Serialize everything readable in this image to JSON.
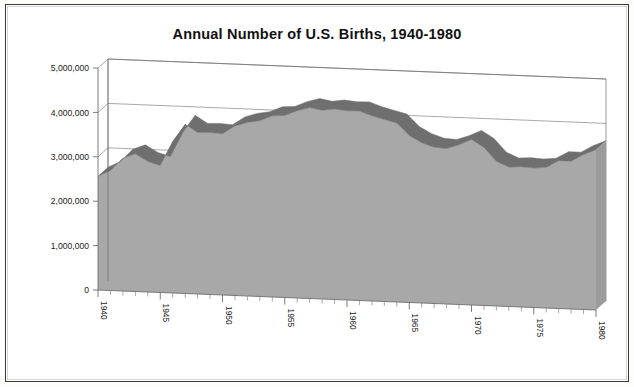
{
  "page": {
    "title": "Annual Number of U.S. Births, 1940-1980",
    "frame_color": "#3a3a3a",
    "background": "#ffffff"
  },
  "chart_data": {
    "type": "area",
    "title": "Annual Number of U.S. Births, 1940-1980",
    "xlabel": "",
    "ylabel": "",
    "ylim": [
      0,
      5000000
    ],
    "xlim": [
      1940,
      1980
    ],
    "grid": true,
    "legend": false,
    "three_d": true,
    "fill_color": "#a8a8a8",
    "ridge_color": "#6f6f6f",
    "axis_color": "#6e6e6e",
    "ytick_labels": [
      "0",
      "1,000,000",
      "2,000,000",
      "3,000,000",
      "4,000,000",
      "5,000,000"
    ],
    "ytick_values": [
      0,
      1000000,
      2000000,
      3000000,
      4000000,
      5000000
    ],
    "xtick_labels": [
      "1940",
      "1945",
      "1950",
      "1955",
      "1960",
      "1965",
      "1970",
      "1975",
      "1980"
    ],
    "xtick_values": [
      1940,
      1945,
      1950,
      1955,
      1960,
      1965,
      1970,
      1975,
      1980
    ],
    "x": [
      1940,
      1941,
      1942,
      1943,
      1944,
      1945,
      1946,
      1947,
      1948,
      1949,
      1950,
      1951,
      1952,
      1953,
      1954,
      1955,
      1956,
      1957,
      1958,
      1959,
      1960,
      1961,
      1962,
      1963,
      1964,
      1965,
      1966,
      1967,
      1968,
      1969,
      1970,
      1971,
      1972,
      1973,
      1974,
      1975,
      1976,
      1977,
      1978,
      1979,
      1980
    ],
    "values": [
      2560000,
      2700000,
      2990000,
      3100000,
      2940000,
      2860000,
      3410000,
      3810000,
      3640000,
      3650000,
      3630000,
      3820000,
      3910000,
      3960000,
      4080000,
      4100000,
      4220000,
      4300000,
      4250000,
      4290000,
      4260000,
      4270000,
      4170000,
      4100000,
      4030000,
      3760000,
      3610000,
      3520000,
      3500000,
      3600000,
      3730000,
      3560000,
      3260000,
      3140000,
      3160000,
      3140000,
      3170000,
      3330000,
      3330000,
      3490000,
      3610000
    ],
    "series_name": "U.S. Births"
  }
}
